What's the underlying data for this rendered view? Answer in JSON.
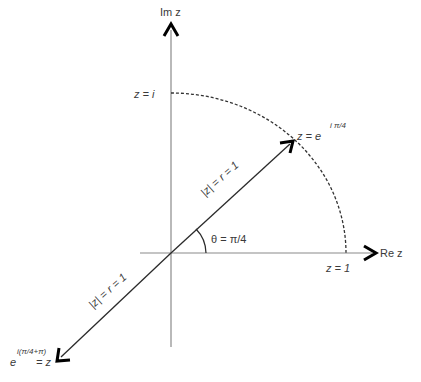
{
  "diagram": {
    "type": "complex-plane unit circle",
    "axes": {
      "imaginary_label": "Im z",
      "real_label": "Re z"
    },
    "points": {
      "z_i": "z = i",
      "z_one": "z = 1",
      "z_pi4_prefix": "z = e",
      "z_pi4_exponent": "i π/4",
      "z_neg_exponent": "i(π/4+π)",
      "z_neg_base": "e",
      "z_neg_suffix": "= z"
    },
    "vectors": {
      "upper_label": "|z| = r = 1",
      "lower_label": "|z| = r = 1"
    },
    "angle_label": "θ = π/4",
    "colors": {
      "axis": "#8a8a8a",
      "vector": "#2a2a2a",
      "arc": "#333333",
      "text": "#3a3a3a"
    }
  }
}
